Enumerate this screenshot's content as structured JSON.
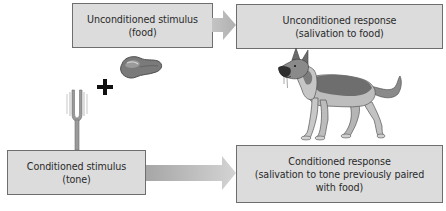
{
  "diagram": {
    "unconditioned_stimulus": {
      "line1": "Unconditioned stimulus",
      "line2": "(food)"
    },
    "unconditioned_response": {
      "line1": "Unconditioned response",
      "line2": "(salivation to food)"
    },
    "conditioned_stimulus": {
      "line1": "Conditioned stimulus",
      "line2": "(tone)"
    },
    "conditioned_response": {
      "line1": "Conditioned response",
      "line2": "(salivation to tone previously paired",
      "line3": "with food)"
    },
    "icons": {
      "food": "meat-steak-icon",
      "plus": "plus-icon",
      "tone": "tuning-fork-icon",
      "dog": "salivating-dog-icon"
    },
    "colors": {
      "box_fill": "#dcdcdc",
      "box_border": "#6e6e6e",
      "arrow": "#b8b8b8",
      "text": "#2a2a2a"
    }
  }
}
